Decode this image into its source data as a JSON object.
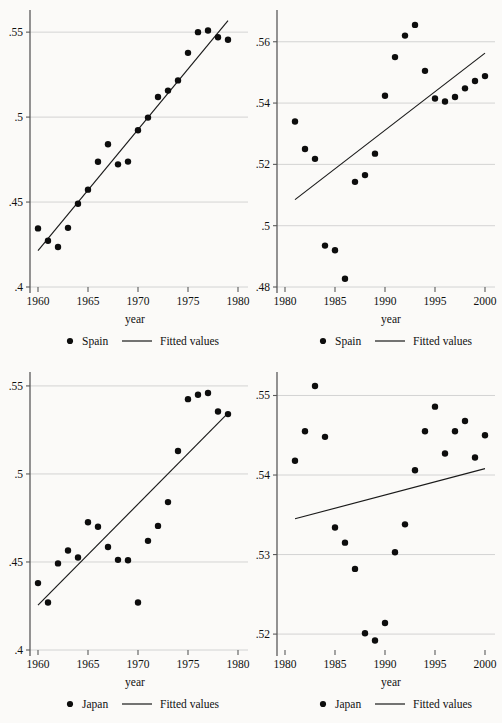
{
  "figure": {
    "background_color": "#fbfaf8",
    "marker_color": "#0d0d0d",
    "line_color": "#1a1a1a",
    "grid_color": "#c9c9c9",
    "axis_color": "#5a5a5a",
    "panel_count": 4
  },
  "chart_data": [
    {
      "type": "scatter",
      "panel": "top-left",
      "title": "",
      "xlabel": "year",
      "ylabel": "",
      "xlim": [
        1959.2,
        1980.4
      ],
      "ylim": [
        0.4,
        0.5595
      ],
      "xticks": [
        1960,
        1965,
        1970,
        1975,
        1980
      ],
      "xtick_labels": [
        "1960",
        "1965",
        "1970",
        "1975",
        "1980"
      ],
      "yticks": [
        0.4,
        0.45,
        0.5,
        0.55
      ],
      "ytick_labels": [
        ".4",
        ".45",
        ".5",
        ".55"
      ],
      "grid": true,
      "legend_position": "below",
      "series": [
        {
          "name": "Spain",
          "marker": "circle",
          "x": [
            1960,
            1961,
            1962,
            1963,
            1964,
            1965,
            1966,
            1967,
            1968,
            1969,
            1970,
            1971,
            1972,
            1973,
            1974,
            1975,
            1976,
            1977,
            1978,
            1979
          ],
          "y": [
            0.4345,
            0.4272,
            0.4235,
            0.4348,
            0.449,
            0.4573,
            0.4737,
            0.484,
            0.4722,
            0.4738,
            0.4923,
            0.4997,
            0.5118,
            0.5156,
            0.5216,
            0.5378,
            0.55,
            0.551,
            0.547,
            0.5455
          ]
        },
        {
          "name": "Fitted values",
          "type": "line",
          "x": [
            1960,
            1979
          ],
          "y": [
            0.4214,
            0.5568
          ]
        }
      ]
    },
    {
      "type": "scatter",
      "panel": "top-right",
      "title": "",
      "xlabel": "year",
      "ylabel": "",
      "xlim": [
        1979.2,
        2000.4
      ],
      "ylim": [
        0.48,
        0.5684
      ],
      "xticks": [
        1980,
        1985,
        1990,
        1995,
        2000
      ],
      "xtick_labels": [
        "1980",
        "1985",
        "1990",
        "1995",
        "2000"
      ],
      "yticks": [
        0.48,
        0.5,
        0.52,
        0.54,
        0.56
      ],
      "ytick_labels": [
        ".48",
        ".5",
        ".52",
        ".54",
        ".56"
      ],
      "grid": true,
      "legend_position": "below",
      "series": [
        {
          "name": "Spain",
          "marker": "circle",
          "x": [
            1981,
            1982,
            1983,
            1984,
            1985,
            1986,
            1987,
            1988,
            1989,
            1990,
            1991,
            1992,
            1993,
            1994,
            1995,
            1996,
            1997,
            1998,
            1999,
            2000
          ],
          "y": [
            0.534,
            0.525,
            0.5218,
            0.4935,
            0.492,
            0.4827,
            0.5143,
            0.5165,
            0.5235,
            0.5424,
            0.555,
            0.562,
            0.5655,
            0.5505,
            0.5415,
            0.5405,
            0.542,
            0.5448,
            0.5472,
            0.5488
          ]
        },
        {
          "name": "Fitted values",
          "type": "line",
          "x": [
            1981,
            2000
          ],
          "y": [
            0.5085,
            0.5563
          ]
        }
      ]
    },
    {
      "type": "scatter",
      "panel": "bottom-left",
      "title": "",
      "xlabel": "year",
      "ylabel": "",
      "xlim": [
        1959.2,
        1980.4
      ],
      "ylim": [
        0.4,
        0.5545
      ],
      "xticks": [
        1960,
        1965,
        1970,
        1975,
        1980
      ],
      "xtick_labels": [
        "1960",
        "1965",
        "1970",
        "1975",
        "1980"
      ],
      "yticks": [
        0.4,
        0.45,
        0.5,
        0.55
      ],
      "ytick_labels": [
        ".4",
        ".45",
        ".5",
        ".55"
      ],
      "grid": true,
      "legend_position": "below",
      "series": [
        {
          "name": "Japan",
          "marker": "circle",
          "x": [
            1960,
            1961,
            1962,
            1963,
            1964,
            1965,
            1966,
            1967,
            1968,
            1969,
            1970,
            1971,
            1972,
            1973,
            1974,
            1975,
            1976,
            1977,
            1978,
            1979
          ],
          "y": [
            0.438,
            0.427,
            0.4492,
            0.4565,
            0.4525,
            0.4726,
            0.47,
            0.4585,
            0.4512,
            0.451,
            0.427,
            0.462,
            0.4705,
            0.484,
            0.513,
            0.5425,
            0.545,
            0.546,
            0.5355,
            0.534
          ]
        },
        {
          "name": "Fitted values",
          "type": "line",
          "x": [
            1960,
            1979
          ],
          "y": [
            0.4255,
            0.5345
          ]
        }
      ]
    },
    {
      "type": "scatter",
      "panel": "bottom-right",
      "title": "",
      "xlabel": "year",
      "ylabel": "",
      "xlim": [
        1979.2,
        2000.4
      ],
      "ylim": [
        0.518,
        0.5522
      ],
      "xticks": [
        1980,
        1985,
        1990,
        1995,
        2000
      ],
      "xtick_labels": [
        "1980",
        "1985",
        "1990",
        "1995",
        "2000"
      ],
      "yticks": [
        0.52,
        0.53,
        0.54,
        0.55
      ],
      "ytick_labels": [
        ".52",
        ".53",
        ".54",
        ".55"
      ],
      "grid": true,
      "legend_position": "below",
      "series": [
        {
          "name": "Japan",
          "marker": "circle",
          "x": [
            1981,
            1982,
            1983,
            1984,
            1985,
            1986,
            1987,
            1988,
            1989,
            1990,
            1991,
            1992,
            1993,
            1994,
            1995,
            1996,
            1997,
            1998,
            1999,
            2000
          ],
          "y": [
            0.5418,
            0.5455,
            0.5512,
            0.5448,
            0.5334,
            0.5315,
            0.5282,
            0.5201,
            0.5192,
            0.5214,
            0.5303,
            0.5338,
            0.5406,
            0.5455,
            0.5486,
            0.5427,
            0.5455,
            0.5468,
            0.5422,
            0.545
          ]
        },
        {
          "name": "Fitted values",
          "type": "line",
          "x": [
            1981,
            2000
          ],
          "y": [
            0.5345,
            0.5408
          ]
        }
      ]
    }
  ],
  "panels": [
    {
      "id": "top-left",
      "xlabel": "year",
      "legend": {
        "marker_label": "Spain",
        "line_label": "Fitted values"
      }
    },
    {
      "id": "top-right",
      "xlabel": "year",
      "legend": {
        "marker_label": "Spain",
        "line_label": "Fitted values"
      }
    },
    {
      "id": "bottom-left",
      "xlabel": "year",
      "legend": {
        "marker_label": "Japan",
        "line_label": "Fitted values"
      }
    },
    {
      "id": "bottom-right",
      "xlabel": "year",
      "legend": {
        "marker_label": "Japan",
        "line_label": "Fitted values"
      }
    }
  ]
}
